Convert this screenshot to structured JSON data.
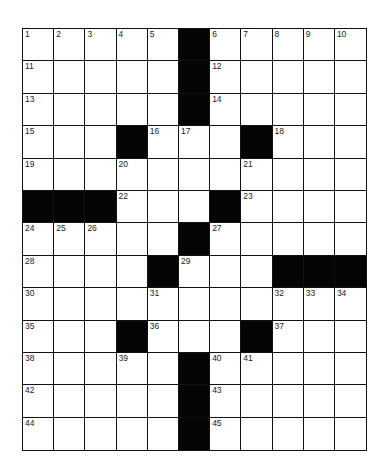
{
  "puzzle": {
    "rows": 13,
    "cols": 11,
    "colors": {
      "block": "#050505",
      "cell": "#ffffff",
      "line": "#111111"
    },
    "grid": [
      [
        "1",
        "2",
        "3",
        "4",
        "5",
        "#",
        "6",
        "7",
        "8",
        "9",
        "10"
      ],
      [
        "11",
        "",
        "",
        "",
        "",
        "#",
        "12",
        "",
        "",
        "",
        ""
      ],
      [
        "13",
        "",
        "",
        "",
        "",
        "#",
        "14",
        "",
        "",
        "",
        ""
      ],
      [
        "15",
        "",
        "",
        "#",
        "16",
        "17",
        "",
        "#",
        "18",
        "",
        ""
      ],
      [
        "19",
        "",
        "",
        "20",
        "",
        "",
        "",
        "21",
        "",
        "",
        ""
      ],
      [
        "#",
        "#",
        "#",
        "22",
        "",
        "",
        "#",
        "23",
        "",
        "",
        ""
      ],
      [
        "24",
        "25",
        "26",
        "",
        "",
        "#",
        "27",
        "",
        "",
        "",
        ""
      ],
      [
        "28",
        "",
        "",
        "",
        "#",
        "29",
        "",
        "",
        "#",
        "#",
        "#"
      ],
      [
        "30",
        "",
        "",
        "",
        "31",
        "",
        "",
        "",
        "32",
        "33",
        "34"
      ],
      [
        "35",
        "",
        "",
        "#",
        "36",
        "",
        "",
        "#",
        "37",
        "",
        ""
      ],
      [
        "38",
        "",
        "",
        "39",
        "",
        "#",
        "40",
        "41",
        "",
        "",
        ""
      ],
      [
        "42",
        "",
        "",
        "",
        "",
        "#",
        "43",
        "",
        "",
        "",
        ""
      ],
      [
        "44",
        "",
        "",
        "",
        "",
        "#",
        "45",
        "",
        "",
        "",
        ""
      ]
    ]
  }
}
